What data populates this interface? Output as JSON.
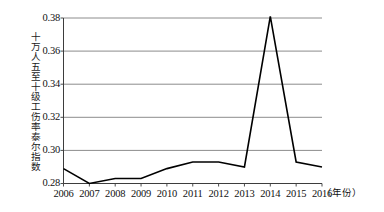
{
  "chart_data": {
    "type": "line",
    "title": "",
    "subtitle": "",
    "xlabel": "年份",
    "xlabel_display": "（年份）",
    "ylabel": "十万人五至十级工伤率泰尔指数",
    "categories": [
      "2006",
      "2007",
      "2008",
      "2009",
      "2010",
      "2011",
      "2012",
      "2013",
      "2014",
      "2015",
      "2016"
    ],
    "x": [
      2006,
      2007,
      2008,
      2009,
      2010,
      2011,
      2012,
      2013,
      2014,
      2015,
      2016
    ],
    "values": [
      0.289,
      0.28,
      0.283,
      0.283,
      0.289,
      0.293,
      0.293,
      0.29,
      0.381,
      0.293,
      0.29
    ],
    "series": [
      {
        "name": "十万人五至十级工伤率泰尔指数",
        "values": [
          0.289,
          0.28,
          0.283,
          0.283,
          0.289,
          0.293,
          0.293,
          0.29,
          0.381,
          0.293,
          0.29
        ]
      }
    ],
    "ylim": [
      0.28,
      0.38
    ],
    "xlim": [
      2006,
      2016
    ],
    "yticks": [
      0.28,
      0.3,
      0.32,
      0.34,
      0.36,
      0.38
    ],
    "ytick_labels": [
      "0.28",
      "0.30",
      "0.32",
      "0.34",
      "0.36",
      "0.38"
    ],
    "xticks": [
      2006,
      2007,
      2008,
      2009,
      2010,
      2011,
      2012,
      2013,
      2014,
      2015,
      2016
    ],
    "xtick_labels": [
      "2006",
      "2007",
      "2008",
      "2009",
      "2010",
      "2011",
      "2012",
      "2013",
      "2014",
      "2015",
      "2016"
    ],
    "grid": true,
    "grid_axis": "y",
    "legend": false,
    "legend_position": "none",
    "annotations": [],
    "colors": {
      "line": "#000000",
      "grid": "#8c8c8c",
      "axis": "#4d4d4d",
      "background": "#ffffff",
      "text": "#111111"
    },
    "line_width": 1.6,
    "markers": false
  }
}
